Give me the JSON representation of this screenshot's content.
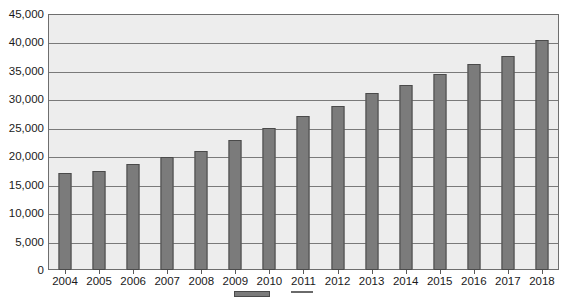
{
  "chart_data": {
    "type": "bar",
    "title": "",
    "xlabel": "",
    "ylabel": "",
    "ylim": [
      0,
      45000
    ],
    "grid": true,
    "legend_position": "bottom",
    "categories": [
      "2004",
      "2005",
      "2006",
      "2007",
      "2008",
      "2009",
      "2010",
      "2011",
      "2012",
      "2013",
      "2014",
      "2015",
      "2016",
      "2017",
      "2018"
    ],
    "values": [
      17000,
      17400,
      18600,
      19900,
      20900,
      22800,
      25000,
      27000,
      28800,
      31100,
      32500,
      34500,
      36200,
      37700,
      40500
    ],
    "ytick_labels": [
      "45,000",
      "40,000",
      "35,000",
      "30,000",
      "25,000",
      "20,000",
      "15,000",
      "10,000",
      "5,000",
      "0"
    ],
    "ytick_values": [
      45000,
      40000,
      35000,
      30000,
      25000,
      20000,
      15000,
      10000,
      5000,
      0
    ],
    "series": [
      {
        "name": "",
        "values": [
          17000,
          17400,
          18600,
          19900,
          20900,
          22800,
          25000,
          27000,
          28800,
          31100,
          32500,
          34500,
          36200,
          37700,
          40500
        ]
      }
    ]
  },
  "legend": {
    "items": [
      {
        "marker": "bar-swatch",
        "label": ""
      },
      {
        "marker": "line-swatch",
        "label": ""
      },
      {
        "marker": "none",
        "label": ""
      }
    ]
  },
  "colors": {
    "bar_fill": "#7b7b7b",
    "bar_border": "#4a4a4a",
    "plot_background": "#ededed",
    "gridline": "#7a7a7a",
    "axis_text": "#1a1a1a"
  }
}
